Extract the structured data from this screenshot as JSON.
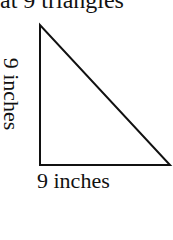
{
  "header": {
    "text": "at 9 triangles"
  },
  "diagram": {
    "shape": "right-triangle",
    "vertical_leg_label": "9 inches",
    "horizontal_leg_label": "9 inches",
    "stroke_color": "#111111"
  }
}
